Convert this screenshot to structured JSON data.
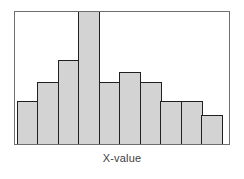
{
  "chart_data": {
    "type": "bar",
    "title": "",
    "subtitle": "",
    "xlabel": "X-value",
    "ylabel": "",
    "grid": false,
    "legend": null,
    "axis_tick_labels": {
      "x": [],
      "y": []
    },
    "ylim": [
      0,
      14
    ],
    "categories": [
      "1",
      "2",
      "3",
      "4",
      "5",
      "6",
      "7",
      "8",
      "9",
      "10"
    ],
    "values": [
      4.5,
      6.5,
      8.8,
      14,
      6.5,
      7.5,
      6.5,
      4.5,
      4.5,
      3
    ],
    "bar_fill_color": "#d3d3d3",
    "bar_edge_color": "#202020",
    "frame_color": "#6f6f6f",
    "background_color": "#ffffff"
  },
  "axis": {
    "xlabel": "X-value"
  }
}
